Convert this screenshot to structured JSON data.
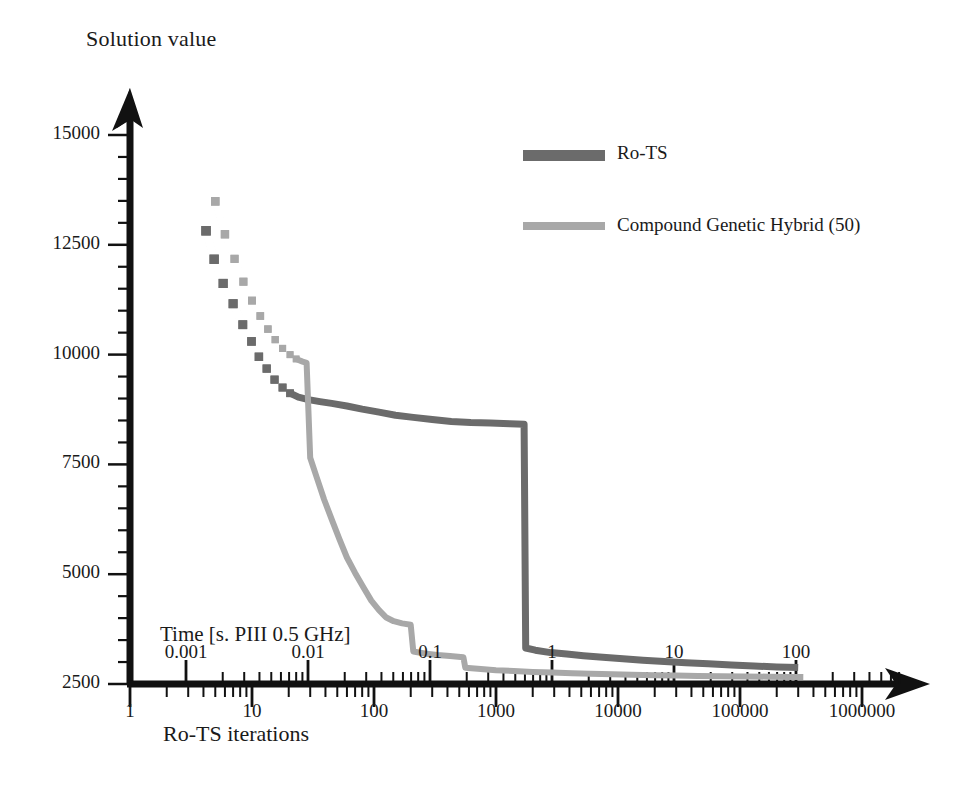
{
  "chart_data": {
    "type": "line",
    "title": "",
    "ylabel": "Solution value",
    "xlabel": "Ro-TS iterations",
    "secondary_xlabel": "Time [s. PIII 0.5 GHz]",
    "xscale": "log",
    "yscale": "linear",
    "xlim": [
      1,
      1000000
    ],
    "ylim": [
      2500,
      15000
    ],
    "grid": false,
    "legend_position": "top-center-right",
    "ytick_labels": [
      "15000",
      "12500",
      "10000",
      "7500",
      "5000",
      "2500"
    ],
    "ytick_values": [
      15000,
      12500,
      10000,
      7500,
      5000,
      2500
    ],
    "xtick_labels": [
      "1",
      "10",
      "100",
      "1000",
      "10000",
      "100000",
      "1000000"
    ],
    "xtick_values": [
      1,
      10,
      100,
      1000,
      10000,
      100000,
      1000000
    ],
    "secondary_xtick_labels": [
      "0.001",
      "0.01",
      "0.1",
      "1",
      "10",
      "100"
    ],
    "secondary_xtick_values": [
      0.001,
      0.01,
      0.1,
      1,
      10,
      100
    ],
    "series": [
      {
        "name": "Ro-TS",
        "color": "#6b6b6b",
        "width": 7,
        "marker": "square",
        "points": [
          [
            4.2,
            12820
          ],
          [
            4.9,
            12170
          ],
          [
            5.8,
            11620
          ],
          [
            7.0,
            11160
          ],
          [
            8.4,
            10680
          ],
          [
            9.9,
            10300
          ],
          [
            11.4,
            9950
          ],
          [
            13.2,
            9680
          ],
          [
            15.3,
            9430
          ],
          [
            17.8,
            9250
          ],
          [
            20.5,
            9120
          ],
          [
            24.0,
            9030
          ],
          [
            29.0,
            8975
          ],
          [
            36.0,
            8930
          ],
          [
            45.0,
            8890
          ],
          [
            60.0,
            8830
          ],
          [
            80.0,
            8760
          ],
          [
            110.0,
            8690
          ],
          [
            150.0,
            8620
          ],
          [
            210.0,
            8570
          ],
          [
            300.0,
            8520
          ],
          [
            430.0,
            8480
          ],
          [
            620.0,
            8455
          ],
          [
            900.0,
            8440
          ],
          [
            1300.0,
            8425
          ],
          [
            1700.0,
            8415
          ],
          [
            1750.0,
            3320
          ],
          [
            2100.0,
            3270
          ],
          [
            2800.0,
            3215
          ],
          [
            3800.0,
            3180
          ],
          [
            5200.0,
            3145
          ],
          [
            7500.0,
            3110
          ],
          [
            11000.0,
            3075
          ],
          [
            16000.0,
            3040
          ],
          [
            24000.0,
            3010
          ],
          [
            36000.0,
            2985
          ],
          [
            55000.0,
            2960
          ],
          [
            85000.0,
            2935
          ],
          [
            130000.0,
            2910
          ],
          [
            200000.0,
            2890
          ],
          [
            300000.0,
            2875
          ]
        ]
      },
      {
        "name": "Compound Genetic Hybrid (50)",
        "color": "#a8a8a8",
        "width": 6,
        "marker": "square",
        "points": [
          [
            5.0,
            13490
          ],
          [
            6.0,
            12740
          ],
          [
            7.2,
            12180
          ],
          [
            8.5,
            11660
          ],
          [
            10.0,
            11230
          ],
          [
            11.7,
            10880
          ],
          [
            13.5,
            10580
          ],
          [
            15.5,
            10340
          ],
          [
            17.8,
            10140
          ],
          [
            20.5,
            10000
          ],
          [
            23.0,
            9900
          ],
          [
            26.0,
            9840
          ],
          [
            28.0,
            9810
          ],
          [
            30.0,
            7650
          ],
          [
            34.0,
            7200
          ],
          [
            39.0,
            6700
          ],
          [
            45.0,
            6250
          ],
          [
            52.0,
            5800
          ],
          [
            60.0,
            5380
          ],
          [
            70.0,
            5030
          ],
          [
            82.0,
            4700
          ],
          [
            95.0,
            4400
          ],
          [
            110.0,
            4180
          ],
          [
            125.0,
            4020
          ],
          [
            145.0,
            3930
          ],
          [
            170.0,
            3880
          ],
          [
            200.0,
            3850
          ],
          [
            210.0,
            3240
          ],
          [
            260.0,
            3195
          ],
          [
            330.0,
            3160
          ],
          [
            420.0,
            3135
          ],
          [
            540.0,
            3110
          ],
          [
            560.0,
            2870
          ],
          [
            750.0,
            2840
          ],
          [
            1000.0,
            2815
          ],
          [
            1400.0,
            2795
          ],
          [
            2000.0,
            2775
          ],
          [
            2900.0,
            2760
          ],
          [
            4200.0,
            2745
          ],
          [
            6000.0,
            2732
          ],
          [
            9000.0,
            2720
          ],
          [
            13000.0,
            2710
          ],
          [
            20000.0,
            2700
          ],
          [
            30000.0,
            2692
          ],
          [
            45000.0,
            2685
          ],
          [
            70000.0,
            2678
          ],
          [
            110000.0,
            2672
          ],
          [
            170000.0,
            2667
          ],
          [
            260000.0,
            2662
          ],
          [
            330000.0,
            2660
          ]
        ]
      }
    ]
  },
  "legend": {
    "entries": [
      {
        "label": "Ro-TS",
        "color": "#6b6b6b"
      },
      {
        "label": "Compound Genetic Hybrid (50)",
        "color": "#a8a8a8"
      }
    ]
  },
  "axes": {
    "y_title": "Solution value",
    "x_title": "Ro-TS iterations",
    "time_title": "Time [s. PIII 0.5 GHz]"
  }
}
